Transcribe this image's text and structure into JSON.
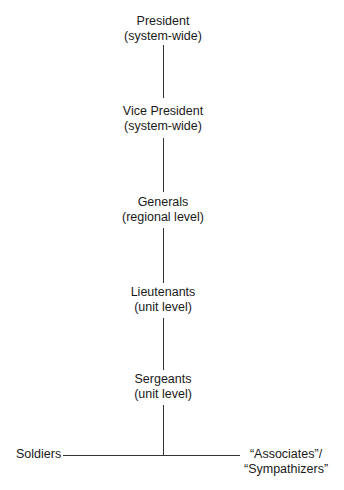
{
  "diagram": {
    "type": "hierarchy",
    "levels": [
      {
        "title": "President",
        "scope": "(system-wide)"
      },
      {
        "title": "Vice President",
        "scope": "(system-wide)"
      },
      {
        "title": "Generals",
        "scope": "(regional level)"
      },
      {
        "title": "Lieutenants",
        "scope": "(unit level)"
      },
      {
        "title": "Sergeants",
        "scope": "(unit level)"
      }
    ],
    "bottom_branches": {
      "left": "Soldiers",
      "right_line1": "“Associates”/",
      "right_line2": "“Sympathizers”"
    }
  }
}
